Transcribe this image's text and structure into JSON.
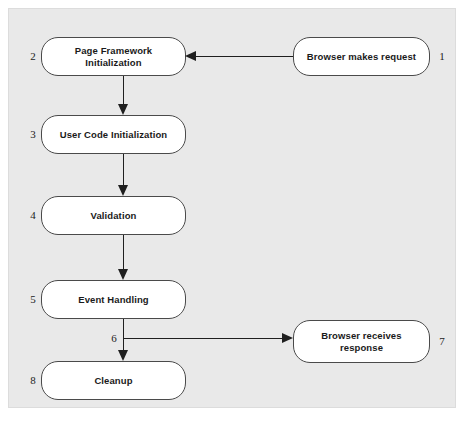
{
  "diagram": {
    "type": "flowchart",
    "panel": {
      "background_color": "#e9e9e9",
      "border_color": "#dcdcdc"
    },
    "node_style": {
      "fill_color": "#ffffff",
      "border_color": "#4a4a4a",
      "text_color": "#1a1a1a"
    },
    "edge_color": "#1f1f1f",
    "nodes": [
      {
        "id": "browser-makes-request",
        "number": "1",
        "label": "Browser makes request"
      },
      {
        "id": "page-framework-initialization",
        "number": "2",
        "label": "Page Framework Initialization"
      },
      {
        "id": "user-code-initialization",
        "number": "3",
        "label": "User Code Initialization"
      },
      {
        "id": "validation",
        "number": "4",
        "label": "Validation"
      },
      {
        "id": "event-handling",
        "number": "5",
        "label": "Event Handling"
      },
      {
        "id": "branch-point",
        "number": "6",
        "label": ""
      },
      {
        "id": "browser-receives-response",
        "number": "7",
        "label": "Browser receives\nresponse"
      },
      {
        "id": "cleanup",
        "number": "8",
        "label": "Cleanup"
      }
    ],
    "edges": [
      {
        "from": "browser-makes-request",
        "to": "page-framework-initialization",
        "direction": "left"
      },
      {
        "from": "page-framework-initialization",
        "to": "user-code-initialization",
        "direction": "down"
      },
      {
        "from": "user-code-initialization",
        "to": "validation",
        "direction": "down"
      },
      {
        "from": "validation",
        "to": "event-handling",
        "direction": "down"
      },
      {
        "from": "event-handling",
        "to": "cleanup",
        "direction": "down"
      },
      {
        "from": "event-handling",
        "to": "browser-receives-response",
        "direction": "right"
      }
    ]
  }
}
